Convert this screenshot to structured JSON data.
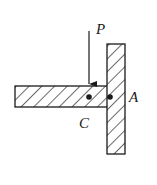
{
  "diagram": {
    "type": "mechanics-joint",
    "labels": {
      "force": "P",
      "point_a": "A",
      "point_c": "C"
    },
    "elements": [
      {
        "name": "horizontal-member",
        "hatched": true
      },
      {
        "name": "vertical-member",
        "hatched": true
      },
      {
        "name": "pin-c",
        "shape": "dot"
      },
      {
        "name": "pin-a",
        "shape": "dot"
      },
      {
        "name": "load-arrow",
        "direction": "down",
        "label": "P"
      }
    ],
    "colors": {
      "stroke": "#1a1a1a",
      "background": "#ffffff"
    }
  }
}
